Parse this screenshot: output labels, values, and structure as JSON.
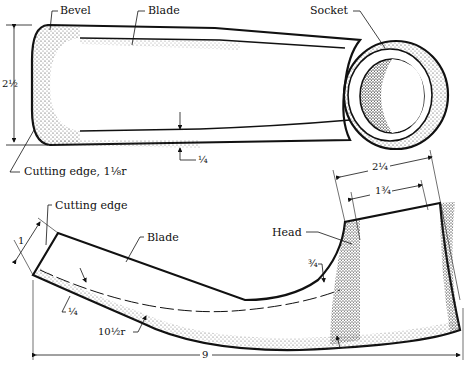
{
  "figure": {
    "top_view": {
      "labels": {
        "bevel": "Bevel",
        "blade": "Blade",
        "socket": "Socket",
        "cutting_edge": "Cutting edge, 1⅛r"
      },
      "dimensions": {
        "width": "2½",
        "thickness": "¼"
      }
    },
    "side_view": {
      "labels": {
        "cutting_edge": "Cutting edge",
        "blade": "Blade",
        "head": "Head"
      },
      "dimensions": {
        "edge_width": "1",
        "blade_thickness": "¼",
        "curve_radius": "10½r",
        "overall_length": "9",
        "head_outer": "2¼",
        "head_inner": "1¾",
        "neck": "¾"
      }
    },
    "colors": {
      "ink": "#111111",
      "paper": "#ffffff",
      "stipple": "#444444"
    }
  }
}
